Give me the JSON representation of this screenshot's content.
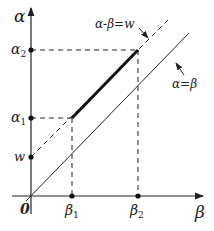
{
  "axes": {
    "y_label": "α",
    "x_label": "β",
    "origin_label": "0"
  },
  "y_ticks": [
    {
      "id": "alpha2",
      "label": "α",
      "sub": "2"
    },
    {
      "id": "alpha1",
      "label": "α",
      "sub": "1"
    },
    {
      "id": "w",
      "label": "w",
      "sub": ""
    }
  ],
  "x_ticks": [
    {
      "id": "beta1",
      "label": "β",
      "sub": "1"
    },
    {
      "id": "beta2",
      "label": "β",
      "sub": "2"
    }
  ],
  "lines": {
    "diagonal_label": "α=β",
    "offset_label": "α-β=w"
  },
  "colors": {
    "stroke": "#222222",
    "background": "#ffffff"
  }
}
